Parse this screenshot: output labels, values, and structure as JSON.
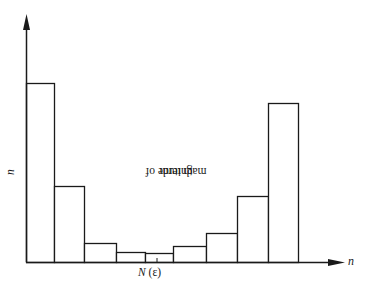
{
  "chart_data": {
    "type": "bar",
    "title": "",
    "xlabel": "n",
    "ylabel": "magnitude of nth term",
    "annotations": [
      {
        "text": "N (ε)",
        "position": "x-axis tick under 5th bar"
      }
    ],
    "categories": [
      "1",
      "2",
      "3",
      "4",
      "5",
      "6",
      "7",
      "8",
      "9"
    ],
    "values": [
      179,
      76,
      19,
      10,
      9,
      16,
      29,
      66,
      159
    ],
    "ylim": [
      0,
      247
    ],
    "grid": false,
    "legend": null,
    "tick_labels_shown": false,
    "bar_edges_px": [
      26,
      54,
      84,
      116,
      145,
      173,
      206,
      237,
      268,
      298
    ]
  },
  "labels": {
    "y_axis": "magnitude of ",
    "y_axis_italic": "n",
    "y_axis_tail": "th term",
    "x_axis": "n",
    "n_epsilon_N": "N",
    "n_epsilon_paren": " (ε)"
  },
  "colors": {
    "stroke": "#1a1a1a",
    "fill": "#ffffff"
  }
}
